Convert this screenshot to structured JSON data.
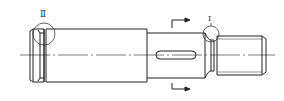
{
  "drawing": {
    "type": "shaft technical drawing",
    "details": [
      {
        "id": "detail-2",
        "label": "Ⅱ"
      },
      {
        "id": "detail-1",
        "label": "Ⅰ"
      }
    ],
    "section_marker": "section cut arrows (unlabeled)",
    "features": [
      "left shoulder with groove",
      "keyway slot",
      "undercut groove",
      "threaded end"
    ],
    "colors": {
      "line": "#222222",
      "background": "#ffffff"
    }
  }
}
